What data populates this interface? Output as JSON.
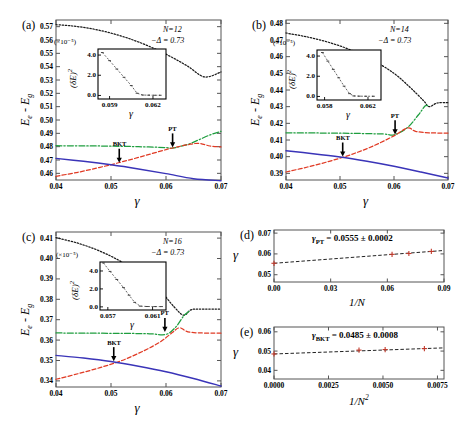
{
  "figure": {
    "width": 459,
    "height": 429,
    "background": "#ffffff"
  },
  "colors": {
    "curve_black": "#1a1a1a",
    "curve_green": "#1f9e3f",
    "curve_red": "#e03a24",
    "curve_blue": "#3a34b8",
    "axis": "#555555",
    "text": "#000000"
  },
  "panels": [
    {
      "id": "a",
      "label": "(a)",
      "annotations": {
        "system_size": "N=12",
        "delta": "−Δ = 0.73"
      },
      "xlabel": "γ",
      "ylabel": "E_e - E_g",
      "xticks": [
        "0.04",
        "0.05",
        "0.06",
        "0.07"
      ],
      "yticks": [
        "0.46",
        "0.47",
        "0.48",
        "0.49",
        "0.50",
        "0.51",
        "0.52",
        "0.53",
        "0.54",
        "0.55",
        "0.56",
        "0.57"
      ],
      "xlim": [
        0.04,
        0.07
      ],
      "ylim": [
        0.455,
        0.575
      ],
      "markers": [
        {
          "name": "BKT",
          "x": 0.0515,
          "y": 0.4672
        },
        {
          "name": "PT",
          "x": 0.0612,
          "y": 0.4787
        }
      ],
      "inset": {
        "exponent_label": "(×10⁻⁵)",
        "ylabel": "(δE)²",
        "xlabel": "γ",
        "xticks": [
          "0.059",
          "0.062"
        ],
        "yticks": [
          "0.0",
          "2.0",
          "4.0"
        ],
        "xlim": [
          0.0582,
          0.0629
        ],
        "ylim": [
          -0.35,
          4.6
        ],
        "data_x": [
          0.0585,
          0.059,
          0.0595,
          0.06,
          0.0605,
          0.0609,
          0.0613,
          0.0617,
          0.0621,
          0.0625
        ],
        "data_y": [
          4.25,
          3.45,
          2.62,
          1.8,
          0.98,
          0.22,
          0.04,
          0.03,
          0.02,
          0.02
        ]
      }
    },
    {
      "id": "b",
      "label": "(b)",
      "annotations": {
        "system_size": "N=14",
        "delta": "−Δ = 0.73"
      },
      "xlabel": "γ",
      "ylabel": "E_e - E_g",
      "xticks": [
        "0.04",
        "0.05",
        "0.06",
        "0.07"
      ],
      "yticks": [
        "0.39",
        "0.40",
        "0.41",
        "0.42",
        "0.43",
        "0.44",
        "0.45",
        "0.46",
        "0.47",
        "0.48"
      ],
      "xlim": [
        0.04,
        0.07
      ],
      "ylim": [
        0.386,
        0.482
      ],
      "markers": [
        {
          "name": "BKT",
          "x": 0.0505,
          "y": 0.3995
        },
        {
          "name": "PT",
          "x": 0.0602,
          "y": 0.4128
        }
      ],
      "inset": {
        "exponent_label": "(×10⁻⁵)",
        "ylabel": "(δE)²",
        "xlabel": "γ",
        "xticks": [
          "0.058",
          "0.062"
        ],
        "yticks": [
          "0.0",
          "2.0",
          "4.0"
        ],
        "xlim": [
          0.0573,
          0.0632
        ],
        "ylim": [
          -0.35,
          4.6
        ],
        "data_x": [
          0.0578,
          0.0583,
          0.0588,
          0.0593,
          0.0598,
          0.0603,
          0.0607,
          0.0612,
          0.0618,
          0.0625
        ],
        "data_y": [
          4.35,
          3.5,
          2.68,
          1.85,
          1.02,
          0.28,
          0.05,
          0.03,
          0.02,
          0.02
        ]
      }
    },
    {
      "id": "c",
      "label": "(c)",
      "annotations": {
        "system_size": "N=16",
        "delta": "−Δ = 0.73"
      },
      "xlabel": "γ",
      "ylabel": "E_e - E_g",
      "xticks": [
        "0.04",
        "0.05",
        "0.06",
        "0.07"
      ],
      "yticks": [
        "0.34",
        "0.35",
        "0.36",
        "0.37",
        "0.38",
        "0.39",
        "0.40",
        "0.41"
      ],
      "xlim": [
        0.04,
        0.07
      ],
      "ylim": [
        0.337,
        0.413
      ],
      "markers": [
        {
          "name": "BKT",
          "x": 0.0505,
          "y": 0.3492
        },
        {
          "name": "PT",
          "x": 0.0598,
          "y": 0.3635
        }
      ],
      "inset": {
        "exponent_label": "(×10⁻⁵)",
        "ylabel": "(δE)²",
        "xlabel": "γ",
        "xticks": [
          "0.057",
          "0.061"
        ],
        "yticks": [
          "0.0",
          "2.0",
          "4.0"
        ],
        "xlim": [
          0.0563,
          0.0622
        ],
        "ylim": [
          -0.35,
          5.0
        ],
        "data_x": [
          0.0566,
          0.0572,
          0.0578,
          0.0584,
          0.0589,
          0.0594,
          0.0599,
          0.0605,
          0.0612,
          0.0618
        ],
        "data_y": [
          4.9,
          3.95,
          3.05,
          2.15,
          1.3,
          0.5,
          0.08,
          0.04,
          0.03,
          0.03
        ]
      }
    },
    {
      "id": "d",
      "label": "(d)",
      "xlabel": "1/N",
      "ylabel": "γ",
      "xticks": [
        "0.00",
        "0.03",
        "0.06",
        "0.09"
      ],
      "yticks": [
        "0.05",
        "0.06",
        "0.07"
      ],
      "xlim": [
        0.0,
        0.09
      ],
      "ylim": [
        0.0465,
        0.0715
      ],
      "fit_text": "γ_PT = 0.0555 ± 0.0002",
      "fit_label_sub": "PT",
      "fit_value": "0.0555 ± 0.0002",
      "points_x": [
        0.0,
        0.0625,
        0.0714,
        0.0833
      ],
      "points_y": [
        0.0555,
        0.0598,
        0.0602,
        0.0612
      ]
    },
    {
      "id": "e",
      "label": "(e)",
      "xlabel": "1/N²",
      "ylabel": "γ",
      "xticks": [
        "0.0000",
        "0.0025",
        "0.0050",
        "0.0075"
      ],
      "yticks": [
        "0.04",
        "0.05",
        "0.06"
      ],
      "xlim": [
        0.0,
        0.0078
      ],
      "ylim": [
        0.0355,
        0.0625
      ],
      "fit_text": "γ_BKT = 0.0485 ± 0.0008",
      "fit_label_sub": "BKT",
      "fit_value": "0.0485 ± 0.0008",
      "points_x": [
        0.0,
        0.0039,
        0.0051,
        0.0069
      ],
      "points_y": [
        0.0485,
        0.0505,
        0.0508,
        0.0513
      ]
    }
  ],
  "chart_data": {
    "type": "line",
    "xlabel": "γ",
    "ylabel": "E_e - E_g",
    "panels": [
      {
        "id": "a",
        "N": 12,
        "delta": 0.73,
        "xlim": [
          0.04,
          0.07
        ],
        "ylim": [
          0.455,
          0.575
        ],
        "grid": false,
        "series": [
          {
            "name": "level-black-dotted",
            "style": "dotted",
            "color": "#1a1a1a",
            "x": [
              0.04,
              0.043,
              0.046,
              0.049,
              0.052,
              0.055,
              0.058,
              0.061,
              0.064,
              0.067,
              0.07
            ],
            "values": [
              0.5715,
              0.5705,
              0.5688,
              0.5662,
              0.5628,
              0.5585,
              0.5533,
              0.5472,
              0.5402,
              0.5323,
              0.536
            ]
          },
          {
            "name": "level-green-dashdot",
            "style": "dashdot",
            "color": "#1f9e3f",
            "x": [
              0.04,
              0.045,
              0.05,
              0.055,
              0.06,
              0.0612,
              0.064,
              0.066,
              0.068,
              0.07
            ],
            "values": [
              0.4807,
              0.4806,
              0.4804,
              0.48,
              0.4793,
              0.4789,
              0.4818,
              0.4852,
              0.4888,
              0.4915
            ]
          },
          {
            "name": "level-red-dashed",
            "style": "dashed",
            "color": "#e03a24",
            "x": [
              0.04,
              0.044,
              0.048,
              0.052,
              0.056,
              0.06,
              0.0612,
              0.064,
              0.066,
              0.068,
              0.07
            ],
            "values": [
              0.4578,
              0.4608,
              0.4645,
              0.4686,
              0.4731,
              0.4778,
              0.479,
              0.4815,
              0.4825,
              0.4805,
              0.4798
            ]
          },
          {
            "name": "level-blue-solid",
            "style": "solid",
            "color": "#3a34b8",
            "x": [
              0.04,
              0.045,
              0.05,
              0.055,
              0.06,
              0.065,
              0.07
            ],
            "values": [
              0.4712,
              0.469,
              0.4664,
              0.4633,
              0.4598,
              0.456,
              0.4545
            ]
          }
        ],
        "annotations": [
          {
            "text": "BKT",
            "x": 0.0515,
            "y": 0.4672
          },
          {
            "text": "PT",
            "x": 0.0612,
            "y": 0.4787
          }
        ],
        "inset": {
          "type": "scatter",
          "ylabel": "(δE)²",
          "xlabel": "γ",
          "yscale_label": "(×10⁻⁵)",
          "x": [
            0.0585,
            0.059,
            0.0595,
            0.06,
            0.0605,
            0.0609,
            0.0613,
            0.0617,
            0.0621,
            0.0625
          ],
          "values": [
            4.25,
            3.45,
            2.62,
            1.8,
            0.98,
            0.22,
            0.04,
            0.03,
            0.02,
            0.02
          ],
          "xlim": [
            0.0582,
            0.0629
          ],
          "ylim": [
            -0.35,
            4.6
          ]
        }
      },
      {
        "id": "b",
        "N": 14,
        "delta": 0.73,
        "xlim": [
          0.04,
          0.07
        ],
        "ylim": [
          0.386,
          0.482
        ],
        "grid": false,
        "series": [
          {
            "name": "level-black-dotted",
            "style": "dotted",
            "color": "#1a1a1a",
            "x": [
              0.04,
              0.044,
              0.048,
              0.052,
              0.056,
              0.06,
              0.063,
              0.0655,
              0.0665,
              0.068,
              0.07
            ],
            "values": [
              0.4742,
              0.4718,
              0.4685,
              0.464,
              0.458,
              0.45,
              0.4415,
              0.4335,
              0.43,
              0.4322,
              0.4324
            ]
          },
          {
            "name": "level-green-dashdot",
            "style": "dashdot",
            "color": "#1f9e3f",
            "x": [
              0.04,
              0.046,
              0.052,
              0.058,
              0.06,
              0.0625,
              0.0645,
              0.0658,
              0.0665
            ],
            "values": [
              0.4143,
              0.4142,
              0.414,
              0.4136,
              0.4131,
              0.4175,
              0.425,
              0.4305,
              0.43
            ]
          },
          {
            "name": "level-red-dashed",
            "style": "dashed",
            "color": "#e03a24",
            "x": [
              0.04,
              0.044,
              0.048,
              0.052,
              0.056,
              0.06,
              0.0625,
              0.064,
              0.0665,
              0.07
            ],
            "values": [
              0.3908,
              0.3938,
              0.3972,
              0.4012,
              0.4062,
              0.4125,
              0.4172,
              0.4152,
              0.4143,
              0.4142
            ]
          },
          {
            "name": "level-blue-solid",
            "style": "solid",
            "color": "#3a34b8",
            "x": [
              0.04,
              0.045,
              0.05,
              0.055,
              0.06,
              0.065,
              0.07
            ],
            "values": [
              0.4035,
              0.4018,
              0.3998,
              0.3972,
              0.3942,
              0.3908,
              0.3872
            ]
          }
        ],
        "annotations": [
          {
            "text": "BKT",
            "x": 0.0505,
            "y": 0.3995
          },
          {
            "text": "PT",
            "x": 0.0602,
            "y": 0.4128
          }
        ],
        "inset": {
          "type": "scatter",
          "ylabel": "(δE)²",
          "xlabel": "γ",
          "yscale_label": "(×10⁻⁵)",
          "x": [
            0.0578,
            0.0583,
            0.0588,
            0.0593,
            0.0598,
            0.0603,
            0.0607,
            0.0612,
            0.0618,
            0.0625
          ],
          "values": [
            4.35,
            3.5,
            2.68,
            1.85,
            1.02,
            0.28,
            0.05,
            0.03,
            0.02,
            0.02
          ],
          "xlim": [
            0.0573,
            0.0632
          ],
          "ylim": [
            -0.35,
            4.6
          ]
        }
      },
      {
        "id": "c",
        "N": 16,
        "delta": 0.73,
        "xlim": [
          0.04,
          0.07
        ],
        "ylim": [
          0.337,
          0.413
        ],
        "grid": false,
        "series": [
          {
            "name": "level-black-dotted",
            "style": "dotted",
            "color": "#1a1a1a",
            "x": [
              0.04,
              0.044,
              0.048,
              0.052,
              0.056,
              0.059,
              0.0615,
              0.0632,
              0.0645,
              0.066,
              0.07
            ],
            "values": [
              0.4102,
              0.4075,
              0.4036,
              0.3982,
              0.3908,
              0.384,
              0.3762,
              0.3722,
              0.3748,
              0.3752,
              0.3752
            ]
          },
          {
            "name": "level-green-dashdot",
            "style": "dashdot",
            "color": "#1f9e3f",
            "x": [
              0.04,
              0.046,
              0.052,
              0.057,
              0.06,
              0.0618,
              0.0632,
              0.0642
            ],
            "values": [
              0.3635,
              0.3634,
              0.3633,
              0.3631,
              0.3628,
              0.3665,
              0.3718,
              0.3742
            ]
          },
          {
            "name": "level-red-dashed",
            "style": "dashed",
            "color": "#e03a24",
            "x": [
              0.04,
              0.044,
              0.048,
              0.052,
              0.056,
              0.059,
              0.0612,
              0.0625,
              0.0645,
              0.07
            ],
            "values": [
              0.3408,
              0.3435,
              0.3465,
              0.35,
              0.3548,
              0.3592,
              0.3638,
              0.366,
              0.3638,
              0.3634
            ]
          },
          {
            "name": "level-blue-solid",
            "style": "solid",
            "color": "#3a34b8",
            "x": [
              0.04,
              0.045,
              0.05,
              0.055,
              0.06,
              0.065,
              0.07
            ],
            "values": [
              0.3525,
              0.3512,
              0.3495,
              0.3472,
              0.3445,
              0.3412,
              0.3375
            ]
          }
        ],
        "annotations": [
          {
            "text": "BKT",
            "x": 0.0505,
            "y": 0.3492
          },
          {
            "text": "PT",
            "x": 0.0598,
            "y": 0.3635
          }
        ],
        "inset": {
          "type": "scatter",
          "ylabel": "(δE)²",
          "xlabel": "γ",
          "yscale_label": "(×10⁻⁵)",
          "x": [
            0.0566,
            0.0572,
            0.0578,
            0.0584,
            0.0589,
            0.0594,
            0.0599,
            0.0605,
            0.0612,
            0.0618
          ],
          "values": [
            4.9,
            3.95,
            3.05,
            2.15,
            1.3,
            0.5,
            0.08,
            0.04,
            0.03,
            0.03
          ],
          "xlim": [
            0.0563,
            0.0622
          ],
          "ylim": [
            -0.35,
            5.0
          ]
        }
      },
      {
        "id": "d",
        "type": "scatter",
        "xlabel": "1/N",
        "ylabel": "γ",
        "xlim": [
          0.0,
          0.09
        ],
        "ylim": [
          0.0465,
          0.0715
        ],
        "x": [
          0.0,
          0.0625,
          0.0714,
          0.0833
        ],
        "values": [
          0.0555,
          0.0598,
          0.0602,
          0.0612
        ],
        "fit_intercept": 0.0555,
        "fit_error": 0.0002,
        "annotation": "γ_PT = 0.0555 ± 0.0002"
      },
      {
        "id": "e",
        "type": "scatter",
        "xlabel": "1/N²",
        "ylabel": "γ",
        "xlim": [
          0.0,
          0.0078
        ],
        "ylim": [
          0.0355,
          0.0625
        ],
        "x": [
          0.0,
          0.0039,
          0.0051,
          0.0069
        ],
        "values": [
          0.0485,
          0.0505,
          0.0508,
          0.0513
        ],
        "fit_intercept": 0.0485,
        "fit_error": 0.0008,
        "annotation": "γ_BKT = 0.0485 ± 0.0008"
      }
    ]
  }
}
